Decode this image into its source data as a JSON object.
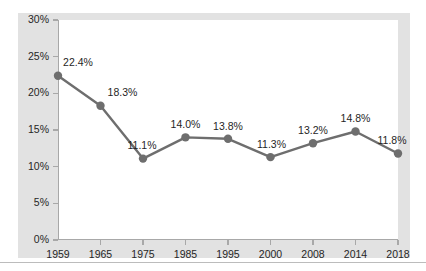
{
  "chart_data": {
    "type": "line",
    "title": "",
    "subtitle": "",
    "xlabel": "",
    "ylabel": "",
    "grid": false,
    "legend": false,
    "ylim": [
      0,
      30
    ],
    "ytick_labels": [
      "30%",
      "25%",
      "20%",
      "15%",
      "10%",
      "5%",
      "0%"
    ],
    "ytick_values": [
      30,
      25,
      20,
      15,
      10,
      5,
      0
    ],
    "categories": [
      "1959",
      "1965",
      "1975",
      "1985",
      "1995",
      "2000",
      "2008",
      "2014",
      "2018"
    ],
    "values": [
      22.4,
      18.3,
      11.1,
      14.0,
      13.8,
      11.3,
      13.2,
      14.8,
      11.8
    ],
    "point_labels": [
      "22.4%",
      "18.3%",
      "11.1%",
      "14.0%",
      "13.8%",
      "11.3%",
      "13.2%",
      "14.8%",
      "11.8%"
    ],
    "series_color": "#6e6e6e",
    "plot_background": "#ffffff",
    "figure_background": "#e2e2e2",
    "axis_color": "#a8a8a8"
  }
}
